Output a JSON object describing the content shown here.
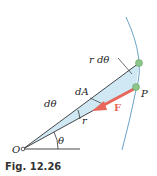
{
  "figure": {
    "caption": "Fig. 12.26",
    "labels": {
      "r_dtheta": "r dθ",
      "dA": "dA",
      "dtheta": "dθ",
      "P": "P",
      "F": "F",
      "r": "r",
      "theta": "θ",
      "O": "O"
    },
    "colors": {
      "sector_fill": "#cfe8f4",
      "arc": "#6aa3c8",
      "force_arrow": "#e8665a",
      "point": "#8cc68a",
      "line": "#333333"
    }
  }
}
